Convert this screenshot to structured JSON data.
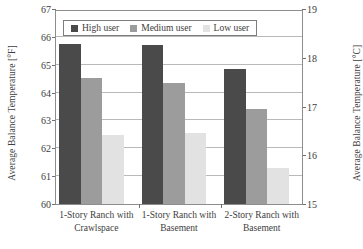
{
  "chart_data": {
    "type": "bar",
    "title": "",
    "xlabel": "",
    "ylabel": "Average Balance Temperature [°F]",
    "ylabel_secondary": "Average Balance Temperature [°C]",
    "categories": [
      "1-Story Ranch with Crawlspace",
      "1-Story Ranch with Basement",
      "2-Story Ranch with Basement"
    ],
    "category_lines": [
      [
        "1-Story Ranch with",
        "Crawlspace"
      ],
      [
        "1-Story Ranch with",
        "Basement"
      ],
      [
        "2-Story Ranch with",
        "Basement"
      ]
    ],
    "series": [
      {
        "name": "High user",
        "values": [
          65.75,
          65.72,
          64.85
        ],
        "color": "#4a4a4a"
      },
      {
        "name": "Medium user",
        "values": [
          64.52,
          64.35,
          63.4
        ],
        "color": "#9c9c9c"
      },
      {
        "name": "Low user",
        "values": [
          62.48,
          62.55,
          61.3
        ],
        "color": "#e2e2e2"
      }
    ],
    "ylim": [
      60,
      67
    ],
    "yticks": [
      60,
      61,
      62,
      63,
      64,
      65,
      66,
      67
    ],
    "ylim_secondary": [
      15,
      19
    ],
    "yticks_secondary": [
      15,
      16,
      17,
      18,
      19
    ],
    "grid": true,
    "legend_position": "top-center",
    "legend_entries": [
      "High user",
      "Medium user",
      "Low user"
    ]
  }
}
